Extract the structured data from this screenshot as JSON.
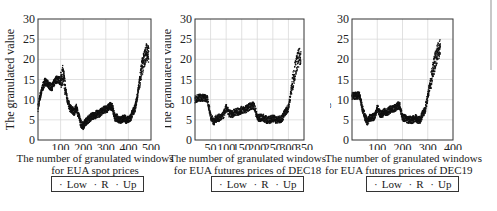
{
  "chart_data": [
    {
      "type": "scatter",
      "title": "",
      "xlabel": "The number of granulated windows for EUA spot prices",
      "ylabel": "The granulated value",
      "xlim": [
        0,
        500
      ],
      "ylim": [
        0,
        30
      ],
      "xticks": [
        100,
        200,
        300,
        400,
        500
      ],
      "yticks": [
        0,
        5,
        10,
        15,
        20,
        25,
        30
      ],
      "grid": true,
      "legend": [
        "Low",
        "R",
        "Up"
      ],
      "legend_position": "below",
      "x": [
        0,
        10,
        20,
        30,
        40,
        50,
        60,
        70,
        80,
        90,
        100,
        110,
        120,
        130,
        140,
        150,
        160,
        170,
        180,
        190,
        200,
        210,
        220,
        230,
        240,
        250,
        260,
        270,
        280,
        290,
        300,
        310,
        320,
        330,
        340,
        350,
        360,
        370,
        380,
        390,
        400,
        410,
        420,
        430,
        440,
        450,
        460,
        470,
        480,
        490
      ],
      "series": [
        {
          "name": "R",
          "values": [
            8,
            11,
            13,
            14.5,
            14,
            13.5,
            13,
            14,
            15,
            15,
            14.5,
            16.5,
            13,
            10,
            8,
            7.5,
            7,
            8,
            6,
            4,
            3.5,
            4.5,
            5,
            5.5,
            6,
            6,
            6.5,
            6.5,
            7,
            7.5,
            7.5,
            8,
            8.5,
            8,
            5.5,
            5.5,
            5,
            5,
            5.5,
            5,
            5,
            5.5,
            7,
            8,
            11,
            15,
            18,
            20,
            22,
            21
          ]
        }
      ]
    },
    {
      "type": "scatter",
      "title": "",
      "xlabel": "The number of granulated windows for EUA futures prices of DEC18",
      "ylabel": "The granulated value",
      "xlim": [
        0,
        350
      ],
      "ylim": [
        0,
        30
      ],
      "xticks": [
        50,
        100,
        150,
        200,
        250,
        300,
        350
      ],
      "yticks": [
        0,
        5,
        10,
        15,
        20,
        25,
        30
      ],
      "grid": true,
      "legend": [
        "Low",
        "R",
        "Up"
      ],
      "legend_position": "below",
      "x": [
        0,
        10,
        20,
        30,
        40,
        50,
        60,
        70,
        80,
        90,
        100,
        110,
        120,
        130,
        140,
        150,
        160,
        170,
        180,
        190,
        200,
        210,
        220,
        230,
        240,
        250,
        260,
        270,
        280,
        290,
        300,
        310,
        320,
        330,
        340
      ],
      "series": [
        {
          "name": "R",
          "values": [
            10,
            10.5,
            10.5,
            10.5,
            10,
            6,
            4.5,
            5.5,
            5.5,
            6,
            8,
            6.5,
            6.5,
            7,
            7,
            7.5,
            7.5,
            8,
            8.5,
            8.5,
            5.5,
            5.5,
            5.5,
            5,
            5,
            5.5,
            5,
            5,
            5.5,
            7,
            8,
            13,
            17,
            20,
            21
          ]
        }
      ]
    },
    {
      "type": "scatter",
      "title": "",
      "xlabel": "The number of granulated windows for EUA futures prices of DEC19",
      "ylabel": "The granulated value",
      "xlim": [
        0,
        400
      ],
      "ylim": [
        0,
        30
      ],
      "xticks": [
        100,
        200,
        300,
        400
      ],
      "yticks": [
        0,
        5,
        10,
        15,
        20,
        25,
        30
      ],
      "grid": true,
      "legend": [
        "Low",
        "R",
        "Up"
      ],
      "legend_position": "below",
      "x": [
        0,
        10,
        20,
        30,
        40,
        50,
        60,
        70,
        80,
        90,
        100,
        110,
        120,
        130,
        140,
        150,
        160,
        170,
        180,
        190,
        200,
        210,
        220,
        230,
        240,
        250,
        260,
        270,
        280,
        290,
        300,
        310,
        320,
        330,
        340,
        350
      ],
      "series": [
        {
          "name": "R",
          "values": [
            11,
            11,
            11,
            11,
            8,
            6,
            4.5,
            5.5,
            5.5,
            6,
            8,
            6.5,
            6.5,
            7,
            7,
            7.5,
            7.5,
            8,
            8.5,
            8.5,
            5.5,
            5.5,
            5,
            5,
            5,
            5.5,
            5,
            5,
            6.5,
            7.5,
            11,
            14,
            17,
            20,
            22,
            23
          ]
        }
      ]
    }
  ],
  "panels": [
    {
      "ylabel": "The granulated value",
      "xlabel_line1": "The number of granulated windows",
      "xlabel_line2": "for EUA spot prices",
      "legend": {
        "low": "Low",
        "r": "R",
        "up": "Up",
        "marker": "·"
      }
    },
    {
      "ylabel": "The granulated value",
      "xlabel_line1": "The number of granulated windows",
      "xlabel_line2": "for EUA futures prices of DEC18",
      "legend": {
        "low": "Low",
        "r": "R",
        "up": "Up",
        "marker": "·"
      }
    },
    {
      "ylabel": "The granulated value",
      "xlabel_line1": "The number of granulated windows",
      "xlabel_line2": "for EUA futures prices of DEC19",
      "legend": {
        "low": "Low",
        "r": "R",
        "up": "Up",
        "marker": "·"
      }
    }
  ],
  "colors": {
    "points": "#111111",
    "axis": "#333333",
    "grid": "#d9d9d9"
  }
}
